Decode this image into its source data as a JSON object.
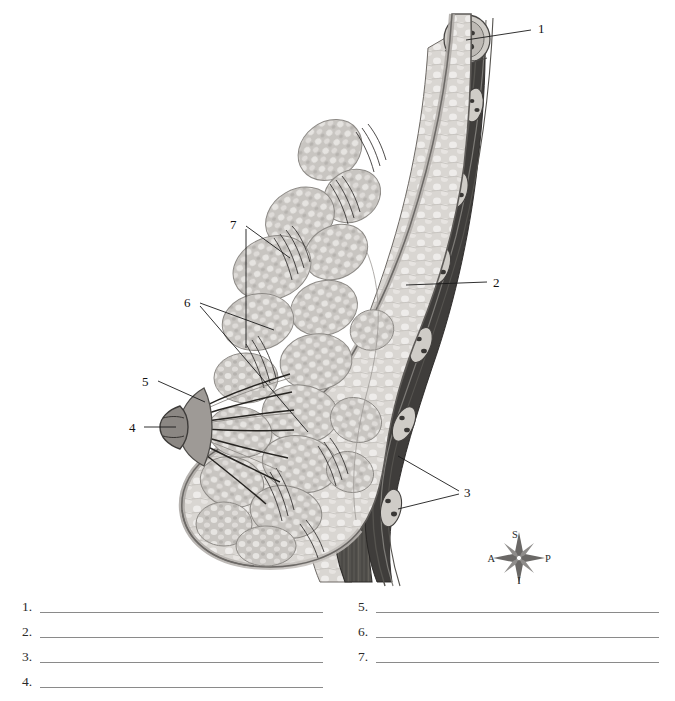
{
  "figure": {
    "callouts": [
      {
        "id": "1",
        "number": "1",
        "x": 541,
        "y": 27,
        "target": "rib-cross-section"
      },
      {
        "id": "2",
        "number": "2",
        "x": 496,
        "y": 282,
        "target": "pectoralis-major-muscle"
      },
      {
        "id": "3",
        "number": "3",
        "x": 467,
        "y": 492,
        "target": "chest-wall-layers"
      },
      {
        "id": "4",
        "number": "4",
        "x": 133,
        "y": 428,
        "target": "nipple"
      },
      {
        "id": "5",
        "number": "5",
        "x": 146,
        "y": 382,
        "target": "areola"
      },
      {
        "id": "6",
        "number": "6",
        "x": 189,
        "y": 303,
        "target": "mammary-lobules"
      },
      {
        "id": "7",
        "number": "7",
        "x": 235,
        "y": 224,
        "target": "suspensory-ligaments"
      }
    ],
    "orientation": {
      "name": "orientation-compass",
      "superior": "S",
      "inferior": "I",
      "anterior": "A",
      "posterior": "P"
    }
  },
  "answers": {
    "left": [
      {
        "number": "1.",
        "value": ""
      },
      {
        "number": "2.",
        "value": ""
      },
      {
        "number": "3.",
        "value": ""
      },
      {
        "number": "4.",
        "value": ""
      }
    ],
    "right": [
      {
        "number": "5.",
        "value": ""
      },
      {
        "number": "6.",
        "value": ""
      },
      {
        "number": "7.",
        "value": ""
      }
    ]
  },
  "colors": {
    "background": "#ffffff",
    "line": "#1a1a1a",
    "answer_rule": "#8a8a8a",
    "skin": "#b9b5b2",
    "fat": "#cfcbc7",
    "gland_light": "#e4e2df",
    "gland_mid": "#b4b1ad",
    "muscle_dark": "#4d4b4a",
    "muscle_mid": "#6f6d6b",
    "bone": "#d6d3cf",
    "outline": "#3a3836"
  }
}
